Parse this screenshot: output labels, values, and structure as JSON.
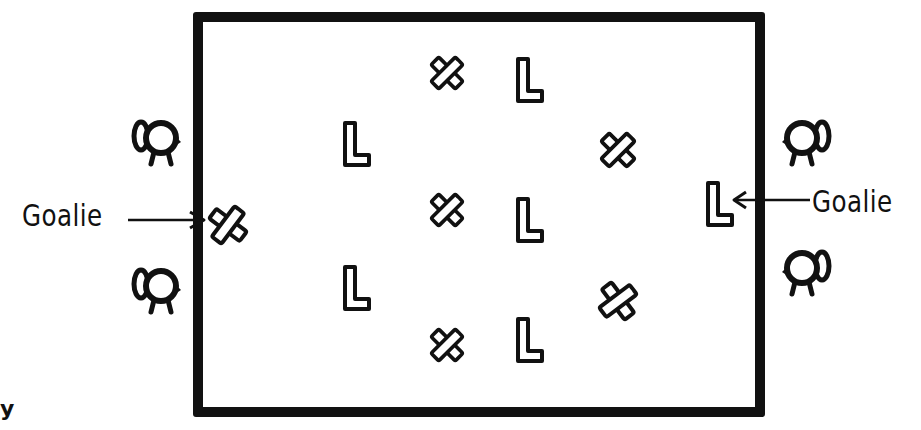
{
  "diagram": {
    "type": "hand-drawn field formation diagram",
    "field": {
      "shape": "rectangle",
      "border_color": "#111111",
      "background": "#ffffff"
    },
    "labels": {
      "left_goalie": "Goalie",
      "right_goalie": "Goalie",
      "corner_fragment": "y"
    },
    "team_x": {
      "symbol": "X",
      "goalie": {
        "x": 228,
        "y": 225
      },
      "players": [
        {
          "x": 447,
          "y": 72
        },
        {
          "x": 617,
          "y": 150
        },
        {
          "x": 447,
          "y": 210
        },
        {
          "x": 617,
          "y": 300
        },
        {
          "x": 447,
          "y": 345
        }
      ]
    },
    "team_l": {
      "symbol": "L",
      "goalie": {
        "x": 720,
        "y": 205
      },
      "players": [
        {
          "x": 530,
          "y": 80
        },
        {
          "x": 357,
          "y": 145
        },
        {
          "x": 530,
          "y": 220
        },
        {
          "x": 357,
          "y": 290
        },
        {
          "x": 530,
          "y": 340
        }
      ]
    },
    "cameras": [
      {
        "side": "left",
        "x": 155,
        "y": 140,
        "facing": "right"
      },
      {
        "side": "left",
        "x": 155,
        "y": 290,
        "facing": "right"
      },
      {
        "side": "right",
        "x": 800,
        "y": 140,
        "facing": "left"
      },
      {
        "side": "right",
        "x": 800,
        "y": 268,
        "facing": "left"
      }
    ]
  }
}
